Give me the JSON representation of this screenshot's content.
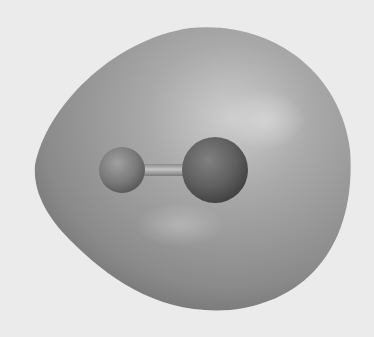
{
  "scene": {
    "subject": "diatomic molecule with enclosing molecular surface",
    "background_color": "#ebebeb",
    "surface_color": "#9a9a9a",
    "surface_highlight": "#c8c8c8",
    "surface_shadow": "#6e6e6e",
    "atoms": [
      {
        "name": "small-atom",
        "cx": 122,
        "cy": 170,
        "r": 23,
        "color": "#7a7a7a"
      },
      {
        "name": "large-atom",
        "cx": 215,
        "cy": 170,
        "r": 33,
        "color": "#5c5c5c"
      }
    ],
    "bond": {
      "x1": 140,
      "y1": 170,
      "x2": 190,
      "y2": 170,
      "thickness": 10
    }
  }
}
